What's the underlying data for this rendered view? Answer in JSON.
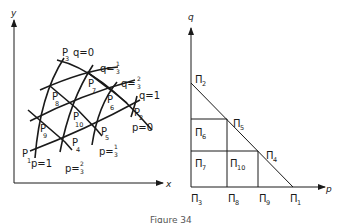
{
  "figure": {
    "caption": "Figure 34",
    "left_panel": {
      "axes": {
        "x_label": "x",
        "y_label": "y"
      },
      "curve_labels": {
        "q0": "q=0",
        "q13": {
          "prefix": "q=",
          "num": "1",
          "den": "3"
        },
        "q23": {
          "prefix": "q=",
          "num": "2",
          "den": "3"
        },
        "q1": "q=1",
        "p0": "p=0",
        "p13": {
          "prefix": "p=",
          "num": "1",
          "den": "3"
        },
        "p23": {
          "prefix": "p=",
          "num": "2",
          "den": "3"
        },
        "p1": "p=1"
      },
      "nodes": [
        {
          "name": "P",
          "sub": "1"
        },
        {
          "name": "P",
          "sub": "2"
        },
        {
          "name": "P",
          "sub": "3"
        },
        {
          "name": "P",
          "sub": "4"
        },
        {
          "name": "P",
          "sub": "5"
        },
        {
          "name": "P",
          "sub": "6"
        },
        {
          "name": "P",
          "sub": "7"
        },
        {
          "name": "P",
          "sub": "8"
        },
        {
          "name": "P",
          "sub": "9"
        },
        {
          "name": "P",
          "sub": "10"
        }
      ]
    },
    "right_panel": {
      "axes": {
        "p_label": "p",
        "q_label": "q"
      },
      "nodes": [
        {
          "name": "Π",
          "sub": "1"
        },
        {
          "name": "Π",
          "sub": "2"
        },
        {
          "name": "Π",
          "sub": "3"
        },
        {
          "name": "Π",
          "sub": "4"
        },
        {
          "name": "Π",
          "sub": "5"
        },
        {
          "name": "Π",
          "sub": "6"
        },
        {
          "name": "Π",
          "sub": "7"
        },
        {
          "name": "Π",
          "sub": "8"
        },
        {
          "name": "Π",
          "sub": "9"
        },
        {
          "name": "Π",
          "sub": "10"
        }
      ]
    }
  }
}
